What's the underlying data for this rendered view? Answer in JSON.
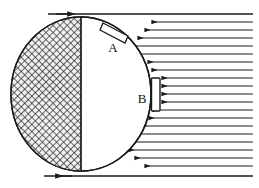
{
  "figure": {
    "background_color": "#ffffff",
    "ink_color": "#1a1a1a",
    "width": 259,
    "height": 188
  },
  "labels": [
    {
      "id": "label-a",
      "text": "A",
      "x": 113,
      "y": 46,
      "refers_to": "upper flap on circle"
    },
    {
      "id": "label-b",
      "text": "B",
      "x": 143,
      "y": 101,
      "refers_to": "side plate on circle"
    }
  ],
  "circle": {
    "name": "main-circle",
    "cx": 81,
    "cy": 94,
    "rx": 70,
    "ry": 77,
    "fill": "#ffffff",
    "stroke": "#1a1a1a"
  },
  "divider": {
    "name": "vertical-divider",
    "x": 81,
    "y_top": 17,
    "y_bottom": 171,
    "stroke": "#1a1a1a"
  },
  "hatched_region": {
    "name": "shaded-left-half",
    "description": "cross-hatched left half of the circle",
    "hatch_spacing": 4,
    "hatch_angle_deg": 45,
    "stroke": "#2a2a2a"
  },
  "flap_a": {
    "name": "flap-a",
    "description": "small angled rectangular flap attached near top-right of circle",
    "points": "104,23 127,35 124,42 101,29",
    "stroke": "#1a1a1a",
    "fill": "#ffffff"
  },
  "plate_b": {
    "name": "plate-b",
    "description": "small vertical rectangular plate on right side of circle",
    "x": 152,
    "y": 78,
    "width": 8,
    "height": 33,
    "stroke": "#1a1a1a",
    "fill": "#ffffff"
  },
  "boundaries": {
    "top_wall": {
      "name": "top-wall",
      "y": 14,
      "x1": 48,
      "x2": 253,
      "arrow": "right",
      "arrow_x": 62
    },
    "bottom_wall": {
      "name": "bottom-wall",
      "y": 176,
      "x1": 44,
      "x2": 253,
      "arrow": "left",
      "arrow_x": 62
    }
  },
  "streamlines": {
    "name": "streamlines",
    "direction": "leftward",
    "count": 19,
    "x_right": 253,
    "arrow_marker": "left-arrowhead",
    "lines": [
      {
        "y": 22,
        "x_left": 152
      },
      {
        "y": 30,
        "x_left": 145
      },
      {
        "y": 38,
        "x_left": 138
      },
      {
        "y": 46,
        "x_left": 132
      },
      {
        "y": 54,
        "x_left": 128
      },
      {
        "y": 62,
        "x_left": 150
      },
      {
        "y": 70,
        "x_left": 152
      },
      {
        "y": 78,
        "x_left": 161
      },
      {
        "y": 86,
        "x_left": 161
      },
      {
        "y": 94,
        "x_left": 161
      },
      {
        "y": 102,
        "x_left": 161
      },
      {
        "y": 110,
        "x_left": 152
      },
      {
        "y": 118,
        "x_left": 150
      },
      {
        "y": 126,
        "x_left": 142
      },
      {
        "y": 134,
        "x_left": 135
      },
      {
        "y": 142,
        "x_left": 129
      },
      {
        "y": 150,
        "x_left": 128
      },
      {
        "y": 158,
        "x_left": 134
      },
      {
        "y": 166,
        "x_left": 143
      }
    ]
  }
}
